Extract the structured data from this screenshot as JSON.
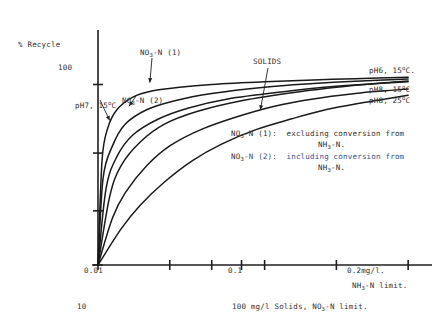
{
  "chart_data": {
    "type": "line",
    "title": "",
    "ylabel": "% Recycle",
    "xlabel": "NH3-N limit.",
    "xscale": "log",
    "xlim": [
      0.01,
      0.22
    ],
    "ylim": [
      0,
      118
    ],
    "grid": false,
    "legend_position": "right-of-curve-ends",
    "yticks": [
      {
        "value": 100,
        "label": "100"
      },
      {
        "value": 62,
        "label": ""
      },
      {
        "value": 30,
        "label": ""
      },
      {
        "value": 0,
        "label": ""
      }
    ],
    "xticks": [
      {
        "value": 0.01,
        "label": "0.01"
      },
      {
        "value": 0.02,
        "label": ""
      },
      {
        "value": 0.03,
        "label": ""
      },
      {
        "value": 0.04,
        "label": ""
      },
      {
        "value": 0.05,
        "label": ""
      },
      {
        "value": 0.1,
        "label": "0.1"
      },
      {
        "value": 0.2,
        "label": "0.2"
      }
    ],
    "secondary_axis_labels": {
      "left_bottom": "10",
      "mid_bottom": "100 mg/l Solids, NO3-N limit.",
      "right_unit": "mg/l.",
      "right_unit_sub": "NH3-N limit."
    },
    "series": [
      {
        "name": "NO3-N (1)",
        "end_label": "",
        "color": "#1a1a1a",
        "points": [
          {
            "x": 0.01,
            "y": 0
          },
          {
            "x": 0.0104,
            "y": 58
          },
          {
            "x": 0.011,
            "y": 76
          },
          {
            "x": 0.012,
            "y": 86
          },
          {
            "x": 0.014,
            "y": 93
          },
          {
            "x": 0.017,
            "y": 96.5
          },
          {
            "x": 0.022,
            "y": 98.5
          },
          {
            "x": 0.03,
            "y": 100
          },
          {
            "x": 0.05,
            "y": 101.5
          },
          {
            "x": 0.08,
            "y": 102.5
          },
          {
            "x": 0.12,
            "y": 103.2
          },
          {
            "x": 0.2,
            "y": 104
          }
        ]
      },
      {
        "name": "pH7, 15 deg C",
        "end_label": "",
        "color": "#1a1a1a",
        "points": [
          {
            "x": 0.01,
            "y": 0
          },
          {
            "x": 0.0105,
            "y": 48
          },
          {
            "x": 0.0115,
            "y": 66
          },
          {
            "x": 0.013,
            "y": 78
          },
          {
            "x": 0.016,
            "y": 86
          },
          {
            "x": 0.021,
            "y": 91
          },
          {
            "x": 0.03,
            "y": 95
          },
          {
            "x": 0.05,
            "y": 98.5
          },
          {
            "x": 0.08,
            "y": 100.5
          },
          {
            "x": 0.12,
            "y": 101.8
          },
          {
            "x": 0.2,
            "y": 103
          }
        ]
      },
      {
        "name": "NO3-N (2)",
        "end_label": "",
        "color": "#1a1a1a",
        "points": [
          {
            "x": 0.01,
            "y": 0
          },
          {
            "x": 0.0108,
            "y": 42
          },
          {
            "x": 0.012,
            "y": 60
          },
          {
            "x": 0.014,
            "y": 72
          },
          {
            "x": 0.018,
            "y": 81
          },
          {
            "x": 0.024,
            "y": 87
          },
          {
            "x": 0.035,
            "y": 92
          },
          {
            "x": 0.06,
            "y": 96
          },
          {
            "x": 0.1,
            "y": 99
          },
          {
            "x": 0.15,
            "y": 100.5
          },
          {
            "x": 0.2,
            "y": 101.5
          }
        ]
      },
      {
        "name": "pH6, 15 deg C",
        "end_label": "pH6, 15°C.",
        "color": "#1a1a1a",
        "points": [
          {
            "x": 0.01,
            "y": 0
          },
          {
            "x": 0.0112,
            "y": 38
          },
          {
            "x": 0.0125,
            "y": 55
          },
          {
            "x": 0.015,
            "y": 68
          },
          {
            "x": 0.019,
            "y": 78
          },
          {
            "x": 0.026,
            "y": 85
          },
          {
            "x": 0.04,
            "y": 91
          },
          {
            "x": 0.07,
            "y": 96
          },
          {
            "x": 0.11,
            "y": 99
          },
          {
            "x": 0.16,
            "y": 101
          },
          {
            "x": 0.2,
            "y": 102
          }
        ]
      },
      {
        "name": "SOLIDS / pH8, 15 deg C",
        "end_label": "pH8, 15°C",
        "color": "#1a1a1a",
        "points": [
          {
            "x": 0.01,
            "y": 0
          },
          {
            "x": 0.0115,
            "y": 26
          },
          {
            "x": 0.013,
            "y": 40
          },
          {
            "x": 0.016,
            "y": 55
          },
          {
            "x": 0.02,
            "y": 66
          },
          {
            "x": 0.027,
            "y": 75
          },
          {
            "x": 0.038,
            "y": 82
          },
          {
            "x": 0.055,
            "y": 88
          },
          {
            "x": 0.08,
            "y": 92
          },
          {
            "x": 0.12,
            "y": 95
          },
          {
            "x": 0.16,
            "y": 96.5
          },
          {
            "x": 0.2,
            "y": 97.5
          }
        ]
      },
      {
        "name": "pH8, 25 deg C",
        "end_label": "pH8, 25°C",
        "color": "#1a1a1a",
        "points": [
          {
            "x": 0.01,
            "y": 0
          },
          {
            "x": 0.0125,
            "y": 20
          },
          {
            "x": 0.015,
            "y": 33
          },
          {
            "x": 0.019,
            "y": 46
          },
          {
            "x": 0.025,
            "y": 58
          },
          {
            "x": 0.033,
            "y": 67
          },
          {
            "x": 0.046,
            "y": 75
          },
          {
            "x": 0.065,
            "y": 81
          },
          {
            "x": 0.09,
            "y": 86
          },
          {
            "x": 0.13,
            "y": 90
          },
          {
            "x": 0.17,
            "y": 92.5
          },
          {
            "x": 0.2,
            "y": 94
          }
        ]
      }
    ],
    "annotations": [
      {
        "name": "no3n1",
        "text": "NO3-N (1)",
        "target_x": 0.0165,
        "target_y": 101
      },
      {
        "name": "no3n2",
        "text": "NO3-N (2)",
        "target_x": 0.0135,
        "target_y": 88
      },
      {
        "name": "solids",
        "text": "SOLIDS",
        "target_x": 0.048,
        "target_y": 86
      },
      {
        "name": "ph7",
        "text": "pH7, 15°C",
        "target_x": 0.0112,
        "target_y": 80
      }
    ]
  },
  "axis": {
    "y_title": "% Recycle",
    "y_tick_100": "100",
    "x_tick_001": "0.01",
    "x_tick_01": "0.1",
    "x_tick_02": "0.2",
    "x_unit_mgl": "mg/l.",
    "x_unit_nh3_pre": "NH",
    "x_unit_nh3_sub": "3",
    "x_unit_nh3_post": "-N limit.",
    "bottom_left_10": "10",
    "bottom_mid_pre": "100 mg/l Solids, NO",
    "bottom_mid_sub": "3",
    "bottom_mid_post": "-N limit."
  },
  "curve_labels": {
    "no3n1_pre": "NO",
    "no3n1_sub": "3",
    "no3n1_post": "-N (1)",
    "no3n2_pre": "NO",
    "no3n2_sub": "3",
    "no3n2_post": "-N (2)",
    "solids": "SOLIDS",
    "ph7_pre": "pH7, 15",
    "ph7_sup": "o",
    "ph7_post": "C",
    "ph6_15_pre": "pH6, 15",
    "ph6_15_sup": "o",
    "ph6_15_post": "C.",
    "ph8_15_pre": "pH8, 15",
    "ph8_15_sup": "o",
    "ph8_15_post": "C",
    "ph8_25_pre": "pH8, 25",
    "ph8_25_sup": "o",
    "ph8_25_post": "C"
  },
  "notes": {
    "note1_pre": "NO",
    "note1_sub": "3",
    "note1_post": "-N (1):  excluding conversion from",
    "note1_cont_pre": "NH",
    "note1_cont_sub": "3",
    "note1_cont_post": "-N.",
    "note2_pre": "NO",
    "note2_sub": "3",
    "note2_post": "-N (2):  including conversion from",
    "note2_cont_pre": "NH",
    "note2_cont_sub": "3",
    "note2_cont_post": "-N."
  }
}
